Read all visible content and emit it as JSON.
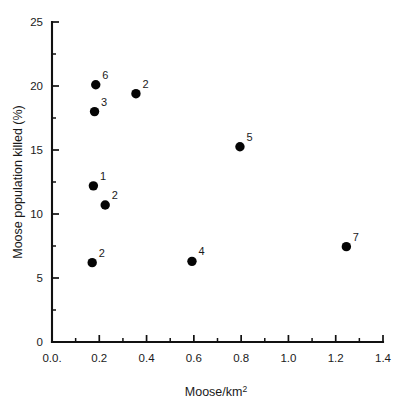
{
  "chart_data": {
    "type": "scatter",
    "title": "",
    "xlabel": "Moose/km2",
    "xlabel_base": "Moose/km",
    "xlabel_sup": "2",
    "ylabel": "Moose population killed (%)",
    "xlim": [
      0.0,
      1.4
    ],
    "ylim": [
      0,
      25
    ],
    "grid": false,
    "legend": "none",
    "x_ticks": [
      0.0,
      0.2,
      0.4,
      0.6,
      0.8,
      1.0,
      1.2,
      1.4
    ],
    "x_tick_labels": [
      "0.0.",
      "0.2",
      "0.4",
      "0.6",
      "0.8",
      "1.0",
      "1.2",
      "1.4"
    ],
    "x_minor_ticks": [
      0.1,
      0.3,
      0.5,
      0.7,
      0.9,
      1.1,
      1.3
    ],
    "y_ticks": [
      0,
      5,
      10,
      15,
      20,
      25
    ],
    "y_tick_labels": [
      "0",
      "5",
      "10",
      "15",
      "20",
      "25"
    ],
    "y_minor_ticks": [
      2.5,
      7.5,
      12.5,
      17.5,
      22.5
    ],
    "marker_color": "#050505",
    "axis_color": "#111111",
    "points": [
      {
        "x": 0.185,
        "y": 20.1,
        "label": "6"
      },
      {
        "x": 0.18,
        "y": 18.0,
        "label": "3"
      },
      {
        "x": 0.355,
        "y": 19.4,
        "label": "2"
      },
      {
        "x": 0.795,
        "y": 15.25,
        "label": "5"
      },
      {
        "x": 0.175,
        "y": 12.2,
        "label": "1"
      },
      {
        "x": 0.225,
        "y": 10.7,
        "label": "2"
      },
      {
        "x": 0.17,
        "y": 6.2,
        "label": "2"
      },
      {
        "x": 0.592,
        "y": 6.3,
        "label": "4"
      },
      {
        "x": 1.245,
        "y": 7.45,
        "label": "7"
      }
    ]
  }
}
